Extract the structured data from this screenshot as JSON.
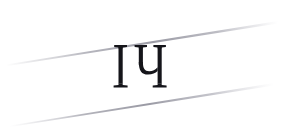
{
  "canvas": {
    "width": 284,
    "height": 132,
    "background_color": "#ffffff"
  },
  "artwork": {
    "title": "IЧ",
    "kind": "decorative-monogram"
  },
  "glyph": {
    "text": "ІЧ",
    "characters": [
      "І",
      "Ч"
    ],
    "description": "serif capital I followed by Cyrillic capital Che",
    "color": "#15151a",
    "font_style": "serif",
    "bounds": {
      "x": 120,
      "y": 53,
      "width": 38,
      "height": 41
    }
  },
  "rules": {
    "color": "#b9b9c0",
    "count": 2,
    "orientation": "diagonal-rising",
    "items": [
      {
        "name": "upper-rule",
        "start": {
          "x": 8,
          "y": 63
        },
        "end": {
          "x": 276,
          "y": 22
        },
        "max_thickness": 2.0,
        "taper": "both-ends"
      },
      {
        "name": "lower-rule",
        "start": {
          "x": 12,
          "y": 124
        },
        "end": {
          "x": 272,
          "y": 84
        },
        "max_thickness": 2.0,
        "taper": "both-ends"
      }
    ]
  }
}
